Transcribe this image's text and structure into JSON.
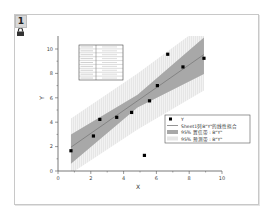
{
  "window": {
    "layer_label": "1",
    "lock_icon": "lock-icon"
  },
  "chart_data": {
    "type": "scatter",
    "title": "",
    "xlabel": "X",
    "ylabel": "Y",
    "xlim": [
      0,
      10
    ],
    "ylim": [
      0,
      10.5
    ],
    "x_ticks": [
      "0",
      "2",
      "4",
      "6",
      "8",
      "10"
    ],
    "y_ticks": [
      "0",
      "2",
      "4",
      "6",
      "8",
      "10"
    ],
    "grid": false,
    "series": [
      {
        "name": "Y",
        "kind": "scatter",
        "x": [
          0.79,
          2.16,
          2.55,
          3.58,
          4.49,
          5.27,
          5.58,
          6.06,
          6.69,
          7.62,
          8.9
        ],
        "y": [
          1.66,
          2.87,
          4.23,
          4.4,
          4.8,
          1.28,
          5.75,
          7.0,
          9.57,
          8.53,
          9.24
        ]
      },
      {
        "name": "Sheet1列B\"Y\"的线性拟合",
        "kind": "line",
        "x": [
          0.79,
          8.9
        ],
        "y": [
          1.95,
          9.55
        ]
      },
      {
        "name": "95% 置信带 : B\"Y\"",
        "kind": "band",
        "x": [
          0.79,
          4.85,
          8.9
        ],
        "upper": [
          3.0,
          6.25,
          10.95
        ],
        "lower": [
          0.6,
          5.2,
          7.95
        ]
      },
      {
        "name": "95% 预测带 : B\"Y\"",
        "kind": "band",
        "x": [
          0.79,
          4.85,
          8.9
        ],
        "upper": [
          4.3,
          8.0,
          12.0
        ],
        "lower": [
          -0.2,
          3.4,
          6.6
        ]
      }
    ],
    "legend": {
      "position": "lower right (inside)",
      "entries": [
        "Y",
        "Sheet1列B\"Y\"的线性拟合",
        "95% 置信带 : B\"Y\"",
        "95% 预测带 : B\"Y\""
      ]
    },
    "inset_table": {
      "position": "upper left",
      "rows": 9,
      "columns": 2,
      "note": "fit statistics table (text illegible at this resolution)"
    }
  },
  "colors": {
    "confidence_band": "#a8a8a8",
    "prediction_band": "#e6e6e6",
    "fit_line": "#7a7a7a",
    "points": "#000000",
    "axis": "#555555"
  }
}
